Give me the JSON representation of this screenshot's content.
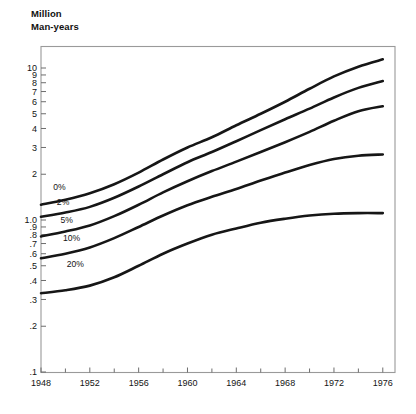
{
  "chart_data": {
    "type": "line",
    "title": "Million\nMan-years",
    "xlabel": "",
    "ylabel": "Million Man-years",
    "y_scale": "log",
    "ylim": [
      0.1,
      13.0
    ],
    "xlim": [
      1948,
      1977
    ],
    "grid": false,
    "legend_position": "inline-left",
    "y_ticks": [
      "10",
      "9",
      "8",
      "7",
      "6",
      "5",
      "4",
      "3",
      "2",
      "1.0",
      ".9",
      ".8",
      ".7",
      ".6",
      ".5",
      ".4",
      ".3",
      ".2",
      ".1"
    ],
    "y_tick_values": [
      10,
      9,
      8,
      7,
      6,
      5,
      4,
      3,
      2,
      1.0,
      0.9,
      0.8,
      0.7,
      0.6,
      0.5,
      0.4,
      0.3,
      0.2,
      0.1
    ],
    "x_ticks": [
      "1948",
      "1952",
      "1956",
      "1960",
      "1964",
      "1968",
      "1972",
      "1976"
    ],
    "x_tick_values": [
      1948,
      1952,
      1956,
      1960,
      1964,
      1968,
      1972,
      1976
    ],
    "x_minor_tick_values": [
      1950,
      1954,
      1958,
      1962,
      1966,
      1970,
      1974
    ],
    "x": [
      1948,
      1950,
      1952,
      1954,
      1956,
      1958,
      1960,
      1962,
      1964,
      1966,
      1968,
      1970,
      1972,
      1974,
      1976
    ],
    "series": [
      {
        "name": "0%",
        "label": "0%",
        "color": "#161616",
        "label_x": 1949.0,
        "label_y": 1.57,
        "values": [
          1.26,
          1.36,
          1.5,
          1.72,
          2.05,
          2.5,
          3.0,
          3.5,
          4.2,
          5.0,
          6.0,
          7.3,
          8.8,
          10.2,
          11.4
        ]
      },
      {
        "name": "2%",
        "label": "2%",
        "color": "#161616",
        "label_x": 1949.3,
        "label_y": 1.25,
        "values": [
          1.05,
          1.12,
          1.22,
          1.4,
          1.66,
          2.0,
          2.4,
          2.8,
          3.3,
          3.9,
          4.6,
          5.4,
          6.4,
          7.4,
          8.2
        ]
      },
      {
        "name": "5%",
        "label": "5%",
        "color": "#161616",
        "label_x": 1949.6,
        "label_y": 0.96,
        "values": [
          0.78,
          0.84,
          0.92,
          1.06,
          1.26,
          1.52,
          1.8,
          2.1,
          2.42,
          2.8,
          3.25,
          3.8,
          4.5,
          5.2,
          5.6
        ]
      },
      {
        "name": "10%",
        "label": "10%",
        "color": "#161616",
        "label_x": 1949.8,
        "label_y": 0.73,
        "values": [
          0.56,
          0.6,
          0.66,
          0.76,
          0.9,
          1.07,
          1.25,
          1.42,
          1.6,
          1.82,
          2.05,
          2.3,
          2.52,
          2.65,
          2.7
        ]
      },
      {
        "name": "20%",
        "label": "20%",
        "color": "#161616",
        "label_x": 1950.1,
        "label_y": 0.49,
        "values": [
          0.33,
          0.345,
          0.37,
          0.42,
          0.5,
          0.6,
          0.7,
          0.8,
          0.88,
          0.96,
          1.02,
          1.07,
          1.1,
          1.11,
          1.11
        ]
      }
    ]
  }
}
